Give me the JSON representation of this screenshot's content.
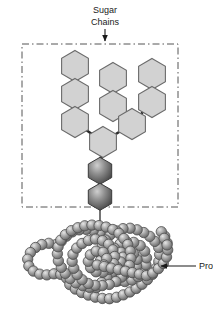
{
  "figure": {
    "background_color": "#ffffff"
  },
  "labels": {
    "sugar_chains_line1": "Sugar",
    "sugar_chains_line2": "Chains",
    "protein": "Protein"
  },
  "annotations": {
    "sugar_arrow_name": "sugar-chains-pointer-arrow",
    "protein_arrow_name": "protein-pointer-arrow"
  },
  "colors": {
    "sugar_hexagon_fill": "#d2d2d2",
    "sugar_hexagon_stroke": "#6b6b6b",
    "core_hexagon_light": "#b9b9b9",
    "core_hexagon_dark": "#4a4a4a",
    "core_hexagon_stroke": "#3a3a3a",
    "bead_light": "#d8d8d8",
    "bead_mid": "#9a9a9a",
    "bead_dark": "#5f5f5f",
    "bead_stroke": "#4f4f4f",
    "bond": "#2b2b2b",
    "dashed_box": "#555555",
    "text": "#1a1a1a"
  },
  "dashed_box": {
    "x": 22,
    "y": 44,
    "width": 156,
    "height": 163,
    "style": "dash-dot"
  },
  "sugar_chain": {
    "description": "Branched oligosaccharide: hexagon monosaccharide residues",
    "residue_count": 9,
    "core_residue_count": 2,
    "hexagons": [
      {
        "id": "L3",
        "cx": 75,
        "cy": 66,
        "r": 15.5,
        "type": "sugar"
      },
      {
        "id": "L2",
        "cx": 75,
        "cy": 94,
        "r": 15.5,
        "type": "sugar"
      },
      {
        "id": "L1",
        "cx": 75,
        "cy": 122,
        "r": 15.5,
        "type": "sugar"
      },
      {
        "id": "M2",
        "cx": 113,
        "cy": 78,
        "r": 15.5,
        "type": "sugar"
      },
      {
        "id": "M1",
        "cx": 113,
        "cy": 106,
        "r": 15.5,
        "type": "sugar"
      },
      {
        "id": "R2",
        "cx": 152,
        "cy": 74,
        "r": 15.5,
        "type": "sugar"
      },
      {
        "id": "R1",
        "cx": 152,
        "cy": 102,
        "r": 15.5,
        "type": "sugar"
      },
      {
        "id": "B1",
        "cx": 132,
        "cy": 124,
        "r": 15.5,
        "type": "sugar"
      },
      {
        "id": "C0",
        "cx": 103,
        "cy": 142,
        "r": 15.5,
        "type": "sugar"
      },
      {
        "id": "N2",
        "cx": 100,
        "cy": 170,
        "r": 13.5,
        "type": "core"
      },
      {
        "id": "N1",
        "cx": 100,
        "cy": 196,
        "r": 13.5,
        "type": "core"
      }
    ],
    "bonds": [
      {
        "from": "L3",
        "to": "L2"
      },
      {
        "from": "L2",
        "to": "L1"
      },
      {
        "from": "L1",
        "to": "C0"
      },
      {
        "from": "M2",
        "to": "M1"
      },
      {
        "from": "M1",
        "to": "B1"
      },
      {
        "from": "R2",
        "to": "R1"
      },
      {
        "from": "R1",
        "to": "B1"
      },
      {
        "from": "B1",
        "to": "C0"
      },
      {
        "from": "C0",
        "to": "N2"
      },
      {
        "from": "N2",
        "to": "N1"
      },
      {
        "from": "N1",
        "to": "protein"
      }
    ]
  },
  "protein": {
    "description": "Folded polypeptide backbone drawn as a coiled chain of residue beads",
    "bead_radius": 5.2,
    "bead_count": 118
  }
}
